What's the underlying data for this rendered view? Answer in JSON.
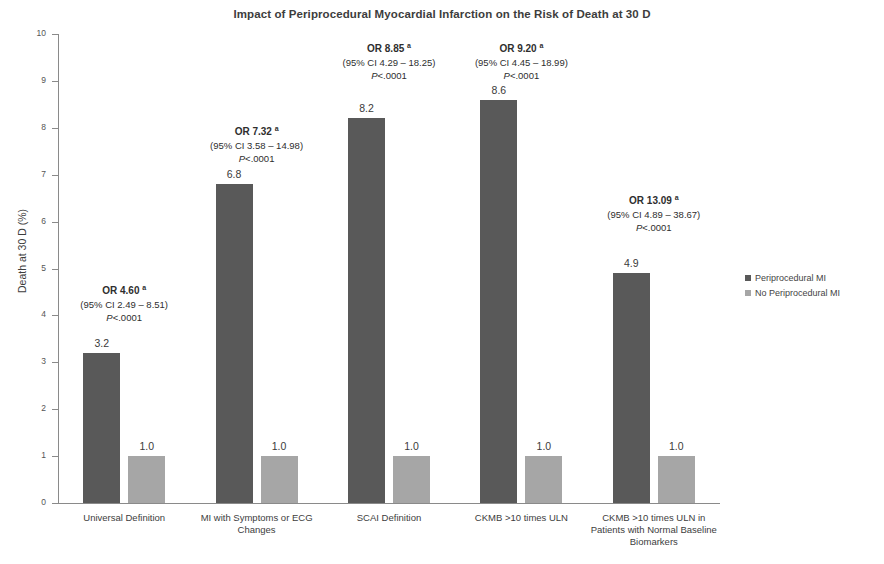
{
  "chart_data": {
    "type": "bar",
    "title": "Impact of Periprocedural Myocardial Infarction on the Risk of Death at 30 D",
    "xlabel": "",
    "ylabel": "Death at 30 D (%)",
    "ylim": [
      0,
      10
    ],
    "ytick_labels": [
      "0",
      "1",
      "2",
      "3",
      "4",
      "5",
      "6",
      "7",
      "8",
      "9",
      "10"
    ],
    "grid": false,
    "legend_position": "right",
    "categories": [
      "Universal Definition",
      "MI with Symptoms or ECG Changes",
      "SCAI Definition",
      "CKMB >10 times ULN",
      "CKMB >10 times ULN in Patients with Normal Baseline Biomarkers"
    ],
    "series": [
      {
        "name": "Periprocedural MI",
        "color": "#595959",
        "values": [
          3.2,
          6.8,
          8.2,
          8.6,
          4.9
        ],
        "value_labels": [
          "3.2",
          "6.8",
          "8.2",
          "8.6",
          "4.9"
        ]
      },
      {
        "name": "No Periprocedural MI",
        "color": "#a6a6a6",
        "values": [
          1.0,
          1.0,
          1.0,
          1.0,
          1.0
        ],
        "value_labels": [
          "1.0",
          "1.0",
          "1.0",
          "1.0",
          "1.0"
        ]
      }
    ],
    "annotations": [
      {
        "odds_ratio": "OR 4.60",
        "superscript": "a",
        "ci": "(95% CI 2.49 – 8.51)",
        "p_prefix": "P",
        "p_value": "<.0001"
      },
      {
        "odds_ratio": "OR 7.32",
        "superscript": "a",
        "ci": "(95% CI 3.58 – 14.98)",
        "p_prefix": "P",
        "p_value": "<.0001"
      },
      {
        "odds_ratio": "OR 8.85",
        "superscript": "a",
        "ci": "(95% CI 4.29 – 18.25)",
        "p_prefix": "P",
        "p_value": "<.0001"
      },
      {
        "odds_ratio": "OR 9.20",
        "superscript": "a",
        "ci": "(95% CI 4.45 – 18.99)",
        "p_prefix": "P",
        "p_value": "<.0001"
      },
      {
        "odds_ratio": "OR 13.09",
        "superscript": "a",
        "ci": "(95% CI 4.89 – 38.67)",
        "p_prefix": "P",
        "p_value": "<.0001"
      }
    ]
  },
  "legend": {
    "items": [
      {
        "label": "Periprocedural MI",
        "color": "#595959"
      },
      {
        "label": "No Periprocedural MI",
        "color": "#a6a6a6"
      }
    ]
  }
}
